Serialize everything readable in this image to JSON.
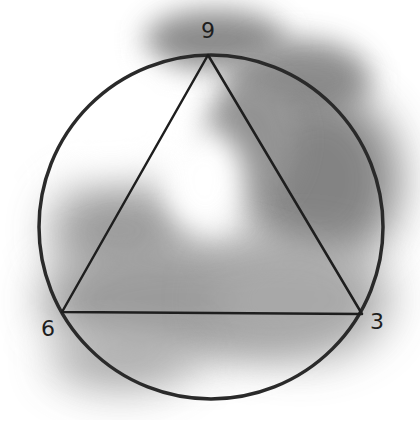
{
  "diagram": {
    "type": "circle-with-inscribed-triangle",
    "circle": {
      "cx": 211,
      "cy": 227,
      "r": 172,
      "stroke": "#2a2a2a"
    },
    "triangle": {
      "points": [
        [
          208,
          55
        ],
        [
          62,
          312
        ],
        [
          362,
          314
        ]
      ],
      "stroke": "#1e1e1e"
    },
    "labels": [
      {
        "text": "9",
        "x": 208,
        "y": 30
      },
      {
        "text": "6",
        "x": 48,
        "y": 328
      },
      {
        "text": "3",
        "x": 377,
        "y": 321
      }
    ],
    "wash_color": "#8a8a8a"
  }
}
